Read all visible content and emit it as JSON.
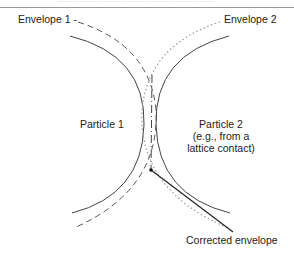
{
  "header": {
    "cut_text": "...................................................."
  },
  "labels": {
    "envelope1": "Envelope 1 -",
    "envelope2": "Envelope 2",
    "particle1": "Particle 1",
    "particle2_line1": "Particle 2",
    "particle2_line2": "(e.g., from a",
    "particle2_line3": "lattice contact)",
    "corrected": "Corrected envelope"
  },
  "colors": {
    "solid": "#444444",
    "dashed": "#555555",
    "dotted": "#9a9a9a",
    "pointer": "#222222"
  }
}
